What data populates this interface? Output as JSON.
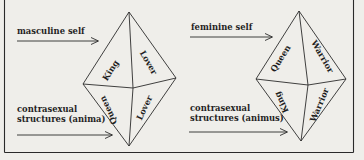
{
  "figure": {
    "left_panel": {
      "self_label": "masculine self",
      "contra_label_line1": "contrasexual",
      "contra_label_line2": "structures (anima)",
      "faces": {
        "upper_left": "King",
        "upper_right": "Lover",
        "lower_left": "Queen",
        "lower_right": "Lover"
      }
    },
    "right_panel": {
      "self_label": "feminine self",
      "contra_label_line1": "contrasexual",
      "contra_label_line2": "structures (animus)",
      "faces": {
        "upper_left": "Queen",
        "upper_right": "Warrior",
        "lower_left": "King",
        "lower_right": "Warrior"
      }
    },
    "colors": {
      "background": "#efeeea",
      "ink": "#1f1f1f"
    }
  }
}
